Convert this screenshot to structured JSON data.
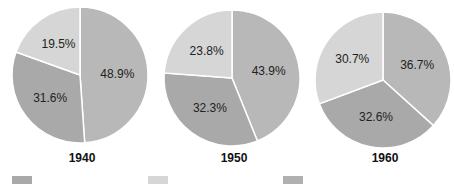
{
  "chart_data": [
    {
      "type": "pie",
      "title": "1940",
      "labels": [
        "A",
        "B",
        "C"
      ],
      "values": [
        48.9,
        31.6,
        19.5
      ],
      "value_labels": [
        "48.9%",
        "31.6%",
        "19.5%"
      ]
    },
    {
      "type": "pie",
      "title": "1950",
      "labels": [
        "A",
        "B",
        "C"
      ],
      "values": [
        43.9,
        32.3,
        23.8
      ],
      "value_labels": [
        "43.9%",
        "32.3%",
        "23.8%"
      ]
    },
    {
      "type": "pie",
      "title": "1960",
      "labels": [
        "A",
        "B",
        "C"
      ],
      "values": [
        36.7,
        32.6,
        30.7
      ],
      "value_labels": [
        "36.7%",
        "32.6%",
        "30.7%"
      ]
    }
  ],
  "colors": {
    "A": "#b8b8b8",
    "B": "#a9a9a9",
    "C": "#d6d6d6"
  },
  "legend": [
    {
      "color": "#a9a9a9"
    },
    {
      "color": "#d6d6d6"
    },
    {
      "color": "#b0b0b0"
    }
  ]
}
